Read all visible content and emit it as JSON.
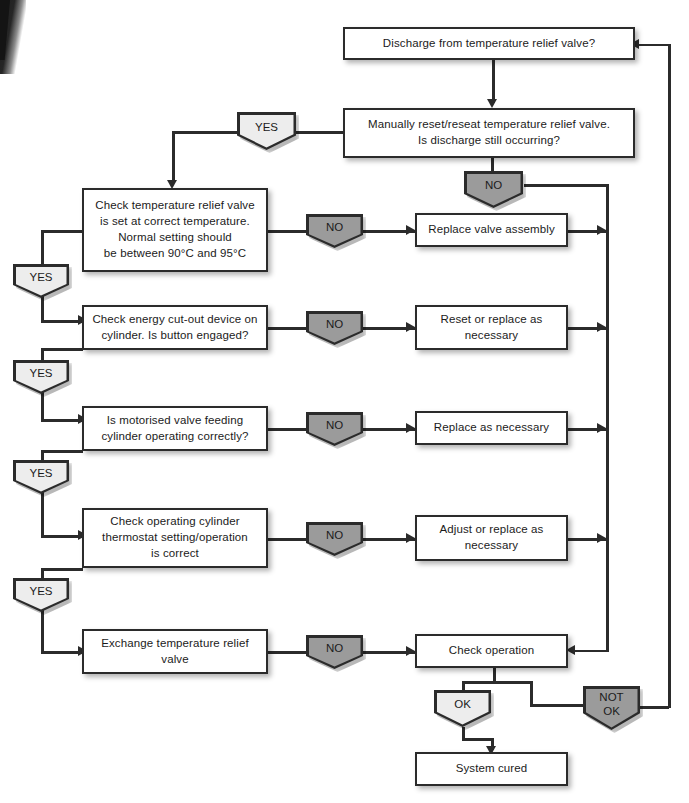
{
  "diagram": {
    "colors": {
      "line": "#2b2b2b",
      "decision_gray": "#9b9b9b",
      "decision_light": "#ededed",
      "box_fill": "#ffffff",
      "background": "#ffffff"
    }
  },
  "nodes": {
    "start": {
      "label": "Discharge from temperature relief valve?"
    },
    "reset": {
      "label": "Manually reset/reseat temperature relief valve.\nIs discharge still occurring?"
    },
    "check_temp": {
      "label": "Check temperature relief valve\nis set at correct temperature.\nNormal setting should\nbe between 90°C and 95°C"
    },
    "replace_valve_assembly": {
      "label": "Replace valve assembly"
    },
    "check_cutout": {
      "label": "Check energy cut-out device on\ncylinder. Is button engaged?"
    },
    "reset_or_replace": {
      "label": "Reset or replace as\nnecessary"
    },
    "check_motorised": {
      "label": "Is motorised valve feeding\ncylinder operating correctly?"
    },
    "replace_as_necessary": {
      "label": "Replace as necessary"
    },
    "check_thermostat": {
      "label": "Check operating cylinder\nthermostat setting/operation\nis correct"
    },
    "adjust_or_replace": {
      "label": "Adjust or replace as\nnecessary"
    },
    "exchange_valve": {
      "label": "Exchange temperature relief\nvalve"
    },
    "check_operation": {
      "label": "Check operation"
    },
    "system_cured": {
      "label": "System cured"
    }
  },
  "decisions": {
    "yes_top": {
      "label": "YES"
    },
    "no_reset": {
      "label": "NO"
    },
    "no_1": {
      "label": "NO"
    },
    "no_2": {
      "label": "NO"
    },
    "no_3": {
      "label": "NO"
    },
    "no_4": {
      "label": "NO"
    },
    "no_5": {
      "label": "NO"
    },
    "yes_1": {
      "label": "YES"
    },
    "yes_2": {
      "label": "YES"
    },
    "yes_3": {
      "label": "YES"
    },
    "yes_4": {
      "label": "YES"
    },
    "ok": {
      "label": "OK"
    },
    "not_ok": {
      "label": "NOT\nOK"
    }
  }
}
